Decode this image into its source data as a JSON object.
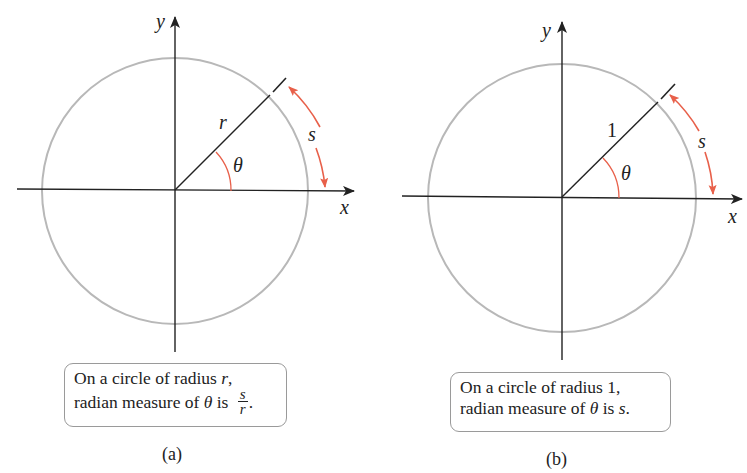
{
  "figure": {
    "panels": [
      {
        "id": "a",
        "label": "(a)",
        "x_axis_label": "x",
        "y_axis_label": "y",
        "radius_label": "r",
        "angle_label": "θ",
        "arc_label": "s",
        "caption": {
          "line1_prefix": "On a circle of radius ",
          "line1_var": "r",
          "line1_suffix": ",",
          "line2_prefix": "radian measure of ",
          "line2_var": "θ",
          "line2_mid": " is ",
          "fraction_numerator": "s",
          "fraction_denominator": "r",
          "line2_suffix": "."
        }
      },
      {
        "id": "b",
        "label": "(b)",
        "x_axis_label": "x",
        "y_axis_label": "y",
        "radius_label": "1",
        "angle_label": "θ",
        "arc_label": "s",
        "caption": {
          "line1": "On a circle of radius 1,",
          "line2_prefix": "radian measure of ",
          "line2_var": "θ",
          "line2_mid": " is ",
          "line2_var2": "s",
          "line2_suffix": "."
        }
      }
    ],
    "colors": {
      "circle": "#b8b8b8",
      "axes": "#222222",
      "accent_arc": "#e8604a"
    }
  }
}
